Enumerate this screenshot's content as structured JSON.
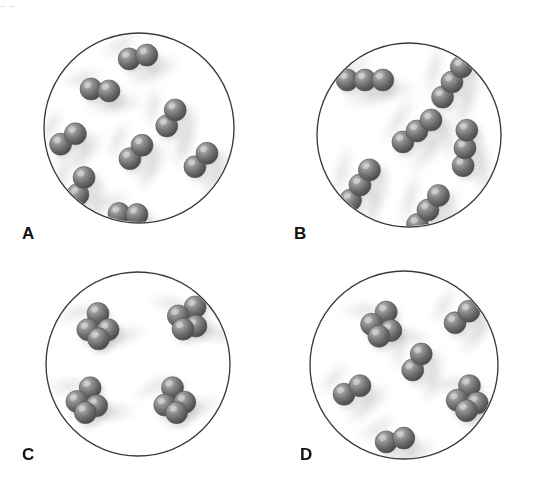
{
  "figure": {
    "background_color": "#ffffff",
    "width": 537,
    "height": 495,
    "top_clipped_text": "p     p",
    "sphere": {
      "base_color": "#6f6f6f",
      "highlight_color": "#c8c8c8",
      "shadow_color": "#3d3d3d",
      "outline_color": "#555555",
      "radius_px": 11
    },
    "flask_outline_color": "#3a3a3a",
    "flask_fill_color": "#ffffff",
    "smudge_color": "#d9d9d9"
  },
  "panels": [
    {
      "id": "A",
      "label": "A",
      "label_x": 22,
      "label_y": 225,
      "circle": {
        "cx": 139,
        "cy": 128,
        "r": 95
      },
      "molecule_type": "diatomic",
      "atoms_per_molecule": 2,
      "molecule_count": 8,
      "description": "Eight identical two-atom molecules, a pure diatomic element",
      "molecules": [
        {
          "cx": 138,
          "cy": 57,
          "angle": -12,
          "n": 2
        },
        {
          "cx": 100,
          "cy": 90,
          "angle": 6,
          "n": 2
        },
        {
          "cx": 68,
          "cy": 139,
          "angle": -35,
          "n": 2
        },
        {
          "cx": 171,
          "cy": 118,
          "angle": -62,
          "n": 2
        },
        {
          "cx": 136,
          "cy": 152,
          "angle": -48,
          "n": 2
        },
        {
          "cx": 201,
          "cy": 160,
          "angle": -48,
          "n": 2
        },
        {
          "cx": 81,
          "cy": 186,
          "angle": -70,
          "n": 2
        },
        {
          "cx": 128,
          "cy": 214,
          "angle": 3,
          "n": 2
        }
      ]
    },
    {
      "id": "B",
      "label": "B",
      "label_x": 294,
      "label_y": 225,
      "circle": {
        "cx": 409,
        "cy": 135,
        "r": 92
      },
      "molecule_type": "triatomic-linear",
      "atoms_per_molecule": 3,
      "molecule_count": 6,
      "description": "Six identical three-atom linear molecules, a pure triatomic compound",
      "molecules": [
        {
          "cx": 365,
          "cy": 80,
          "angle": 0,
          "n": 3
        },
        {
          "cx": 452,
          "cy": 82,
          "angle": -58,
          "n": 3
        },
        {
          "cx": 417,
          "cy": 131,
          "angle": -38,
          "n": 3
        },
        {
          "cx": 465,
          "cy": 148,
          "angle": -84,
          "n": 3
        },
        {
          "cx": 360,
          "cy": 185,
          "angle": -58,
          "n": 3
        },
        {
          "cx": 428,
          "cy": 210,
          "angle": -54,
          "n": 3
        }
      ]
    },
    {
      "id": "C",
      "label": "C",
      "label_x": 22,
      "label_y": 456,
      "circle": {
        "cx": 138,
        "cy": 364,
        "r": 92
      },
      "molecule_type": "tetrahedral",
      "atoms_per_molecule": 4,
      "molecule_count": 4,
      "description": "Four identical four-atom tetrahedral molecules, a pure tetratomic compound",
      "molecules": [
        {
          "cx": 98,
          "cy": 324,
          "angle": 0,
          "n": 4
        },
        {
          "cx": 190,
          "cy": 316,
          "angle": 30,
          "n": 4
        },
        {
          "cx": 88,
          "cy": 398,
          "angle": 12,
          "n": 4
        },
        {
          "cx": 174,
          "cy": 398,
          "angle": -8,
          "n": 4
        }
      ]
    },
    {
      "id": "D",
      "label": "D",
      "label_x": 300,
      "label_y": 456,
      "circle": {
        "cx": 404,
        "cy": 365,
        "r": 94
      },
      "molecule_type": "mixture",
      "atoms_per_molecule": "2 and 4",
      "molecule_count": 6,
      "description": "A mixture: three four-atom molecules and three two-atom molecules",
      "molecules": [
        {
          "cx": 383,
          "cy": 322,
          "angle": 18,
          "n": 4
        },
        {
          "cx": 462,
          "cy": 317,
          "angle": -40,
          "n": 2
        },
        {
          "cx": 417,
          "cy": 362,
          "angle": -62,
          "n": 2
        },
        {
          "cx": 468,
          "cy": 396,
          "angle": 8,
          "n": 4
        },
        {
          "cx": 352,
          "cy": 390,
          "angle": -28,
          "n": 2
        },
        {
          "cx": 395,
          "cy": 440,
          "angle": -12,
          "n": 2
        }
      ]
    }
  ]
}
